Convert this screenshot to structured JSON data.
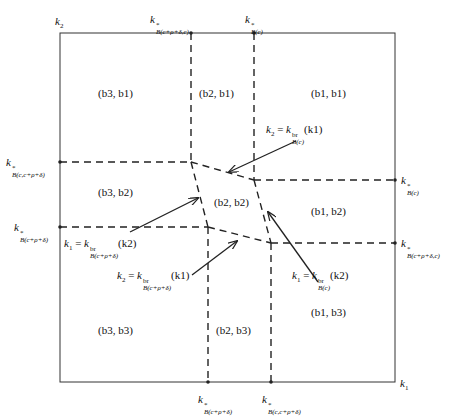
{
  "axes": {
    "x_label": "k1",
    "y_label": "k2"
  },
  "top_ticks": [
    {
      "id": "top-left",
      "base": "k",
      "sup": "*",
      "sub": "B(c+ρ+δ,c)"
    },
    {
      "id": "top-right",
      "base": "k",
      "sup": "*",
      "sub": "B(c)"
    }
  ],
  "left_ticks": [
    {
      "id": "left-top",
      "base": "k",
      "sup": "*",
      "sub": "B(c,c+ρ+δ)"
    },
    {
      "id": "left-bottom",
      "base": "k",
      "sup": "*",
      "sub": "B(c+ρ+δ)"
    }
  ],
  "right_ticks": [
    {
      "id": "right-top",
      "base": "k",
      "sup": "*",
      "sub": "B(c)"
    },
    {
      "id": "right-bottom",
      "base": "k",
      "sup": "*",
      "sub": "B(c+ρ+δ,c)"
    }
  ],
  "bottom_ticks": [
    {
      "id": "bottom-left",
      "base": "k",
      "sup": "*",
      "sub": "B(c+ρ+δ)"
    },
    {
      "id": "bottom-right",
      "base": "k",
      "sup": "*",
      "sub": "B(c,c+ρ+δ)"
    }
  ],
  "regions": [
    {
      "id": "b3-b1",
      "label": "(b3, b1)"
    },
    {
      "id": "b2-b1",
      "label": "(b2, b1)"
    },
    {
      "id": "b1-b1",
      "label": "(b1, b1)"
    },
    {
      "id": "b3-b2",
      "label": "(b3, b2)"
    },
    {
      "id": "b2-b2",
      "label": "(b2, b2)"
    },
    {
      "id": "b1-b2",
      "label": "(b1, b2)"
    },
    {
      "id": "b3-b3",
      "label": "(b3, b3)"
    },
    {
      "id": "b2-b3",
      "label": "(b2, b3)"
    },
    {
      "id": "b1-b3",
      "label": "(b1, b3)"
    }
  ],
  "annotations": [
    {
      "id": "br-c-k1",
      "lhs": "k2",
      "base": "k",
      "sup": "br",
      "sub": "B(c)",
      "arg": "(k1)"
    },
    {
      "id": "br-crd-k2",
      "lhs": "k1",
      "base": "k",
      "sup": "br",
      "sub": "B(c+ρ+δ)",
      "arg": "(k2)"
    },
    {
      "id": "br-crd-k1",
      "lhs": "k2",
      "base": "k",
      "sup": "br",
      "sub": "B(c+ρ+δ)",
      "arg": "(k1)"
    },
    {
      "id": "br-c-k2",
      "lhs": "k1",
      "base": "k",
      "sup": "br",
      "sub": "B(c)",
      "arg": "(k2)"
    }
  ],
  "colors": {
    "line": "#222222",
    "background": "#ffffff"
  }
}
